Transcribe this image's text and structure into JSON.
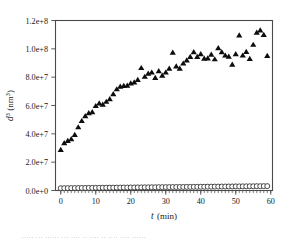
{
  "chart_data": {
    "type": "scatter",
    "title": "",
    "xlabel": "t (min)",
    "xlabel_italic": "t",
    "xlabel_unit": "(min)",
    "ylabel": "d³ (nm³)",
    "ylabel_italic": "d",
    "ylabel_exponent": "3",
    "ylabel_unit_base": "(nm",
    "ylabel_unit_exponent": "3",
    "ylabel_unit_close": ")",
    "xlim": [
      -1.5,
      60.5
    ],
    "ylim": [
      0,
      120000000
    ],
    "xticks": [
      0,
      10,
      20,
      30,
      40,
      50,
      60
    ],
    "xticklabels": [
      "0",
      "10",
      "20",
      "30",
      "40",
      "50",
      "60"
    ],
    "yticks": [
      0,
      20000000,
      40000000,
      60000000,
      80000000,
      100000000,
      120000000
    ],
    "yticklabels": [
      "0.0e+0",
      "2.0e+7",
      "4.0e+7",
      "6.0e+7",
      "8.0e+7",
      "1.0e+8",
      "1.2e+8"
    ],
    "grid": false,
    "legend": "none",
    "frame": "box",
    "tick_direction": "out",
    "minor_xticks_count": 60,
    "series": [
      {
        "name": "d3-filled-triangles",
        "marker": "triangle-up",
        "marker_color": "#0d0d0d",
        "filled": true,
        "x": [
          0,
          1,
          2,
          3,
          4,
          5,
          6,
          7,
          8,
          9,
          10,
          11,
          12,
          13,
          14,
          15,
          16,
          17,
          18,
          19,
          20,
          21,
          22,
          23,
          24,
          25,
          26,
          27,
          28,
          29,
          30,
          31,
          32,
          33,
          34,
          35,
          36,
          37,
          38,
          39,
          40,
          41,
          42,
          43,
          44,
          45,
          46,
          47,
          48,
          49,
          50,
          51,
          52,
          53,
          54,
          55,
          56,
          57,
          58,
          59
        ],
        "y": [
          28800000,
          33600000,
          35200000,
          36400000,
          39400000,
          44800000,
          49200000,
          52600000,
          54800000,
          55400000,
          59800000,
          61600000,
          60800000,
          62800000,
          64600000,
          68200000,
          71600000,
          73400000,
          74000000,
          74200000,
          75800000,
          76400000,
          78200000,
          86600000,
          80400000,
          82600000,
          83400000,
          79600000,
          84400000,
          81200000,
          83400000,
          86200000,
          97400000,
          87800000,
          86200000,
          89800000,
          92000000,
          94400000,
          97800000,
          94400000,
          96400000,
          93200000,
          93400000,
          96000000,
          92800000,
          100600000,
          97800000,
          95400000,
          94600000,
          89000000,
          96400000,
          109600000,
          95400000,
          98000000,
          93000000,
          103000000,
          111600000,
          113200000,
          110000000,
          95200000
        ]
      },
      {
        "name": "baseline-open-circles",
        "marker": "circle",
        "marker_color": "#2b2b2b",
        "filled": false,
        "x": [
          0,
          1,
          2,
          3,
          4,
          5,
          6,
          7,
          8,
          9,
          10,
          11,
          12,
          13,
          14,
          15,
          16,
          17,
          18,
          19,
          20,
          21,
          22,
          23,
          24,
          25,
          26,
          27,
          28,
          29,
          30,
          31,
          32,
          33,
          34,
          35,
          36,
          37,
          38,
          39,
          40,
          41,
          42,
          43,
          44,
          45,
          46,
          47,
          48,
          49,
          50,
          51,
          52,
          53,
          54,
          55,
          56,
          57,
          58,
          59
        ],
        "y": [
          1600000,
          1650000,
          1700000,
          1700000,
          1750000,
          1750000,
          1800000,
          1800000,
          1850000,
          1850000,
          1900000,
          1900000,
          1950000,
          1950000,
          2000000,
          2000000,
          2050000,
          2050000,
          2100000,
          2100000,
          2150000,
          2150000,
          2200000,
          2200000,
          2250000,
          2250000,
          2300000,
          2300000,
          2350000,
          2350000,
          2400000,
          2400000,
          2450000,
          2450000,
          2500000,
          2500000,
          2550000,
          2550000,
          2600000,
          2600000,
          2650000,
          2650000,
          2700000,
          2700000,
          2750000,
          2750000,
          2800000,
          2800000,
          2850000,
          2850000,
          2900000,
          2900000,
          2950000,
          2950000,
          3000000,
          3000000,
          3050000,
          3050000,
          3100000,
          3100000
        ]
      }
    ]
  },
  "caption": {
    "blurred_text": "∙∙∙∙∙ ∙∙∙ ∙∙∙∙∙∙ ∙∙∙ ∙∙∙∙ ∙∙ ∙∙∙∙ ∙∙ ∙∙∙∙ ∙∙∙∙ ∙∙∙∙∙∙"
  },
  "colors": {
    "axis": "#4a4a4a",
    "triangle": "#0d0d0d",
    "circle_stroke": "#2b2b2b",
    "background": "#ffffff"
  }
}
